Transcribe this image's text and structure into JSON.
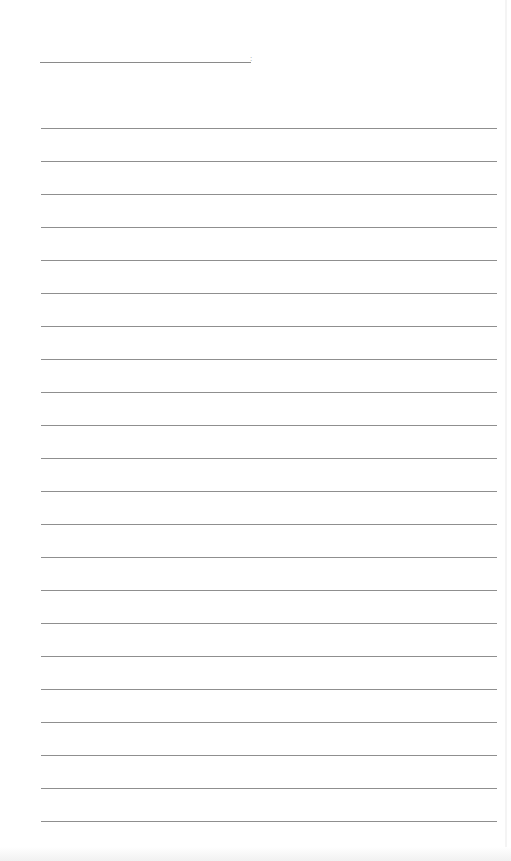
{
  "document": {
    "type": "lined-paper",
    "header": {
      "name_line_mark": ":"
    },
    "rules": {
      "count": 22,
      "first_top_px": 128,
      "spacing_px": 33,
      "color": "#8f8f8f"
    },
    "background_color": "#ffffff"
  }
}
